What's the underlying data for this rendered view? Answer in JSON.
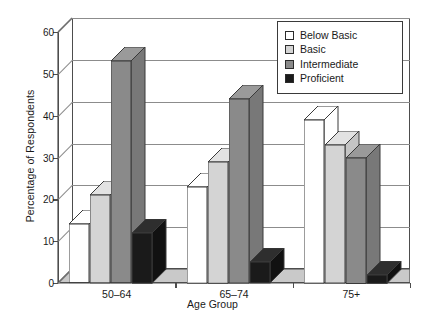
{
  "chart_data": {
    "type": "bar",
    "title": "",
    "xlabel": "Age Group",
    "ylabel": "Percentage of Respondents",
    "categories": [
      "50–64",
      "65–74",
      "75+"
    ],
    "series": [
      {
        "name": "Below Basic",
        "color": "#ffffff",
        "values": [
          14,
          23,
          39
        ]
      },
      {
        "name": "Basic",
        "color": "#d4d4d4",
        "values": [
          21,
          29,
          33
        ]
      },
      {
        "name": "Intermediate",
        "color": "#8a8a8a",
        "values": [
          53,
          44,
          30
        ]
      },
      {
        "name": "Proficient",
        "color": "#1a1a1a",
        "values": [
          12,
          5,
          2
        ]
      }
    ],
    "ylim": [
      0,
      60
    ],
    "yticks": [
      0,
      10,
      20,
      30,
      40,
      50,
      60
    ],
    "ytick_labels": [
      "0",
      "10",
      "20",
      "30",
      "40",
      "50",
      "60"
    ],
    "grid": true,
    "legend_position": "top-right",
    "style": "3d-grouped-bar"
  },
  "axes": {
    "y_title": "Percentage of Respondents",
    "x_title": "Age Group"
  },
  "legend": {
    "entries": [
      {
        "label": "Below Basic",
        "swatch": "#ffffff"
      },
      {
        "label": "Basic",
        "swatch": "#d4d4d4"
      },
      {
        "label": "Intermediate",
        "swatch": "#8a8a8a"
      },
      {
        "label": "Proficient",
        "swatch": "#1a1a1a"
      }
    ]
  }
}
